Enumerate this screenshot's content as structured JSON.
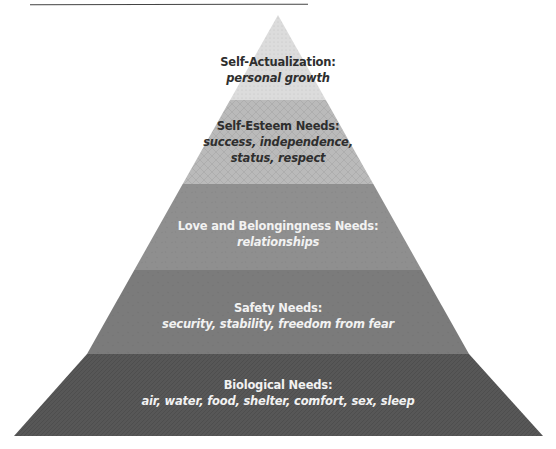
{
  "colors": {
    "level1": "#dcdcdc",
    "level2": "#b9b9b9",
    "level3": "#8e8e8e",
    "level4": "#7b7b7b",
    "level5": "#575757",
    "dark_text": "#2e2e2e",
    "light_text": "#f2f2f2"
  },
  "levels": [
    {
      "title": "Self-Actualization:",
      "subtitle": "personal growth"
    },
    {
      "title": "Self-Esteem Needs:",
      "subtitle_lines": [
        "success, independence,",
        "status, respect"
      ]
    },
    {
      "title": "Love and Belongingness Needs:",
      "subtitle": "relationships"
    },
    {
      "title": "Safety Needs:",
      "subtitle": "security, stability, freedom from fear"
    },
    {
      "title": "Biological Needs:",
      "subtitle": "air, water, food, shelter, comfort, sex, sleep"
    }
  ]
}
